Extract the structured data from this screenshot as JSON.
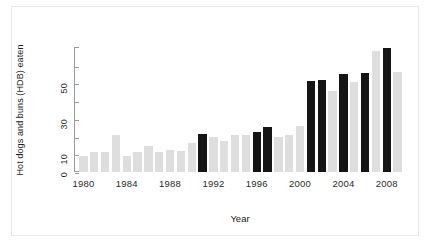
{
  "chart_data": {
    "type": "bar",
    "title": "",
    "xlabel": "Year",
    "ylabel": "Hot dogs and buns (HDB) eaten",
    "ylim": [
      0,
      70
    ],
    "grid": false,
    "legend": "none",
    "y_ticks_major": [
      0,
      10,
      30,
      50
    ],
    "y_ticks_minor": [
      20,
      40,
      60
    ],
    "y_tick_labels": [
      "0",
      "10",
      "30",
      "50"
    ],
    "x_tick_labels": [
      "1980",
      "1984",
      "1988",
      "1992",
      "1996",
      "2000",
      "2004",
      "2008"
    ],
    "x_ticks": [
      1980,
      1984,
      1988,
      1992,
      1996,
      2000,
      2004,
      2008
    ],
    "categories": [
      1980,
      1981,
      1982,
      1983,
      1984,
      1985,
      1986,
      1987,
      1988,
      1989,
      1990,
      1991,
      1992,
      1993,
      1994,
      1995,
      1996,
      1997,
      1998,
      1999,
      2000,
      2001,
      2002,
      2003,
      2004,
      2005,
      2006,
      2007,
      2008,
      2009
    ],
    "values": [
      9,
      11,
      11,
      20,
      9,
      11,
      14,
      11,
      12,
      11.5,
      16,
      21,
      19,
      17,
      20,
      20,
      22,
      24.5,
      19,
      20.5,
      25,
      50,
      50.5,
      44.5,
      53.5,
      49,
      54,
      66,
      68,
      54.5
    ],
    "series": [
      {
        "name": "New record",
        "color": "#151515",
        "years": [
          1991,
          1996,
          1997,
          2001,
          2002,
          2004,
          2006,
          2008
        ]
      },
      {
        "name": "No new record",
        "color": "#dedede",
        "years": [
          1980,
          1981,
          1982,
          1983,
          1984,
          1985,
          1986,
          1987,
          1988,
          1989,
          1990,
          1992,
          1993,
          1994,
          1995,
          1998,
          1999,
          2000,
          2003,
          2005,
          2007,
          2009
        ]
      }
    ],
    "bar_colors": [
      "#dedede",
      "#dedede",
      "#dedede",
      "#dedede",
      "#dedede",
      "#dedede",
      "#dedede",
      "#dedede",
      "#dedede",
      "#dedede",
      "#dedede",
      "#151515",
      "#dedede",
      "#dedede",
      "#dedede",
      "#dedede",
      "#151515",
      "#151515",
      "#dedede",
      "#dedede",
      "#dedede",
      "#151515",
      "#151515",
      "#dedede",
      "#151515",
      "#dedede",
      "#151515",
      "#dedede",
      "#151515",
      "#dedede"
    ]
  },
  "axes": {
    "y_title": "Hot dogs and buns (HDB) eaten",
    "x_title": "Year"
  },
  "colors": {
    "record_bar": "#151515",
    "plain_bar": "#dedede",
    "axis": "#9a9a9a",
    "text": "#2b2b2b",
    "background": "#ffffff",
    "frame": "#e9e9e9"
  }
}
